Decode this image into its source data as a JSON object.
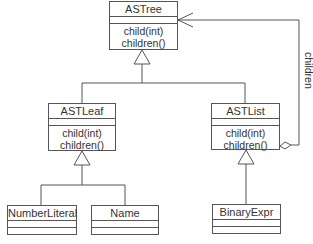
{
  "diagram": {
    "type": "uml-class-diagram",
    "classes": [
      {
        "id": "astree",
        "name": "ASTree",
        "methods": [
          "child(int)",
          "children()"
        ]
      },
      {
        "id": "astleaf",
        "name": "ASTLeaf",
        "methods": [
          "child(int)",
          "children()"
        ]
      },
      {
        "id": "astlist",
        "name": "ASTList",
        "methods": [
          "child(int)",
          "children()"
        ]
      },
      {
        "id": "numberliteral",
        "name": "NumberLiteral",
        "methods": []
      },
      {
        "id": "name",
        "name": "Name",
        "methods": []
      },
      {
        "id": "binaryexpr",
        "name": "BinaryExpr",
        "methods": []
      }
    ],
    "relations": [
      {
        "type": "generalization",
        "from": "ASTLeaf",
        "to": "ASTree"
      },
      {
        "type": "generalization",
        "from": "ASTList",
        "to": "ASTree"
      },
      {
        "type": "generalization",
        "from": "NumberLiteral",
        "to": "ASTLeaf"
      },
      {
        "type": "generalization",
        "from": "Name",
        "to": "ASTLeaf"
      },
      {
        "type": "generalization",
        "from": "BinaryExpr",
        "to": "ASTList"
      },
      {
        "type": "aggregation",
        "from": "ASTList",
        "to": "ASTree",
        "label": "children"
      }
    ],
    "association_label": "children"
  }
}
